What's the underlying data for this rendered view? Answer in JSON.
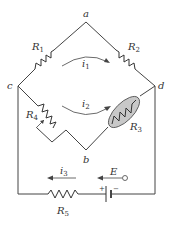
{
  "diagram": {
    "type": "Wheatstone bridge circuit",
    "nodes": {
      "a": "a",
      "b": "b",
      "c": "c",
      "d": "d"
    },
    "components": {
      "R1": {
        "letter": "R",
        "sub": "1",
        "between": "c-a"
      },
      "R2": {
        "letter": "R",
        "sub": "2",
        "between": "a-d"
      },
      "R3": {
        "letter": "R",
        "sub": "3",
        "between": "b-d",
        "note": "shaded (sensor element)"
      },
      "R4": {
        "letter": "R",
        "sub": "4",
        "between": "c-b",
        "note": "variable resistor"
      },
      "R5": {
        "letter": "R",
        "sub": "5",
        "between": "c-battery"
      },
      "E": {
        "letter": "E",
        "polarity_plus": "+",
        "polarity_minus": "−"
      }
    },
    "currents": {
      "i1": {
        "letter": "i",
        "sub": "1"
      },
      "i2": {
        "letter": "i",
        "sub": "2"
      },
      "i3": {
        "letter": "i",
        "sub": "3"
      }
    },
    "colors": {
      "wire": "#444444",
      "r3_fill": "#c8c8c8"
    }
  }
}
